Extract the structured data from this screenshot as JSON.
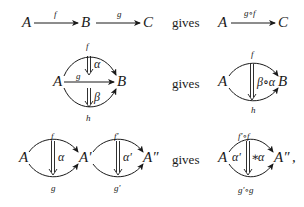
{
  "connector_word": "gives",
  "rows": [
    {
      "name": "morphism-composition",
      "lhs": {
        "objects": [
          "A",
          "B",
          "C"
        ],
        "arrows": [
          {
            "from": "A",
            "to": "B",
            "label": "f"
          },
          {
            "from": "B",
            "to": "C",
            "label": "g"
          }
        ]
      },
      "rhs": {
        "objects": [
          "A",
          "C"
        ],
        "arrows": [
          {
            "from": "A",
            "to": "C",
            "label": "g∘f"
          }
        ]
      }
    },
    {
      "name": "vertical-composition",
      "lhs": {
        "objects": [
          "A",
          "B"
        ],
        "arrows": [
          {
            "from": "A",
            "to": "B",
            "label": "f",
            "position": "top"
          },
          {
            "from": "A",
            "to": "B",
            "label": "g",
            "position": "middle"
          },
          {
            "from": "A",
            "to": "B",
            "label": "h",
            "position": "bottom"
          }
        ],
        "cells": [
          {
            "label": "α",
            "from": "f",
            "to": "g"
          },
          {
            "label": "β",
            "from": "g",
            "to": "h"
          }
        ]
      },
      "rhs": {
        "objects": [
          "A",
          "B"
        ],
        "arrows": [
          {
            "from": "A",
            "to": "B",
            "label": "f",
            "position": "top"
          },
          {
            "from": "A",
            "to": "B",
            "label": "h",
            "position": "bottom"
          }
        ],
        "cells": [
          {
            "label": "β∘α",
            "from": "f",
            "to": "h"
          }
        ]
      }
    },
    {
      "name": "horizontal-composition",
      "lhs": {
        "objects": [
          "A",
          "A′",
          "A″"
        ],
        "arrows": [
          {
            "from": "A",
            "to": "A′",
            "label": "f",
            "position": "top"
          },
          {
            "from": "A",
            "to": "A′",
            "label": "g",
            "position": "bottom"
          },
          {
            "from": "A′",
            "to": "A″",
            "label": "f′",
            "position": "top"
          },
          {
            "from": "A′",
            "to": "A″",
            "label": "g′",
            "position": "bottom"
          }
        ],
        "cells": [
          {
            "label": "α",
            "from": "f",
            "to": "g"
          },
          {
            "label": "α′",
            "from": "f′",
            "to": "g′"
          }
        ]
      },
      "rhs": {
        "objects": [
          "A",
          "A″"
        ],
        "arrows": [
          {
            "from": "A",
            "to": "A″",
            "label": "f′∘f",
            "position": "top"
          },
          {
            "from": "A",
            "to": "A″",
            "label": "g′∘g",
            "position": "bottom"
          }
        ],
        "cells": [
          {
            "label_left": "α′",
            "operator": "∗",
            "label_right": "α",
            "from": "f′∘f",
            "to": "g′∘g"
          }
        ],
        "trailing": ","
      }
    }
  ],
  "colors": {
    "ink": "#1a1a1a",
    "background": "#ffffff"
  }
}
